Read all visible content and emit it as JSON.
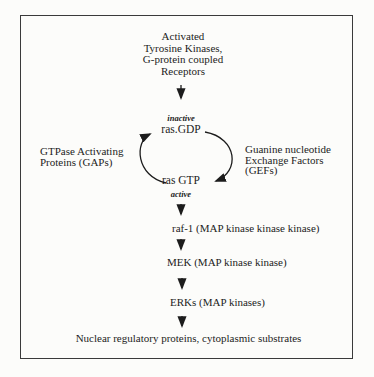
{
  "figure": {
    "colors": {
      "background": "#fcfcfa",
      "ink": "#1c1c1c",
      "frame": "#3a3a3a"
    },
    "header": {
      "lines": [
        "Activated",
        "Tyrosine Kinases,",
        "G-protein coupled",
        "Receptors"
      ]
    },
    "cycle": {
      "inactive_label": "inactive",
      "ras_gdp_label": "ras.GDP",
      "ras_gtp_label": "ras GTP",
      "active_label": "active",
      "gaps": {
        "lines": [
          "GTPase Activating",
          "Proteins (GAPs)"
        ]
      },
      "gefs": {
        "lines": [
          "Guanine nucleotide",
          "Exchange Factors",
          "(GEFs)"
        ]
      }
    },
    "cascade": [
      {
        "label": "raf-1 (MAP kinase kinase kinase)"
      },
      {
        "label": "MEK (MAP kinase kinase)"
      },
      {
        "label": "ERKs (MAP kinases)"
      }
    ],
    "footer_label": "Nuclear regulatory proteins, cytoplasmic substrates"
  }
}
